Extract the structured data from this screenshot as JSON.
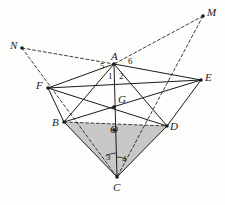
{
  "figure": {
    "background_color": "#fdfdfc",
    "stroke_color": "#1b1b1b",
    "shaded_fill": "#c8c8c8",
    "canvas": {
      "width": 225,
      "height": 205
    }
  },
  "vertices": [
    {
      "id": "N",
      "label": "N",
      "x": 22,
      "y": 48,
      "label_x": 10,
      "label_y": 40,
      "dot": true
    },
    {
      "id": "M",
      "label": "M",
      "x": 203,
      "y": 16,
      "label_x": 207,
      "label_y": 7,
      "dot": true
    },
    {
      "id": "A",
      "label": "A",
      "x": 114,
      "y": 64,
      "label_x": 111,
      "label_y": 51,
      "dot": true
    },
    {
      "id": "F",
      "label": "F",
      "x": 48,
      "y": 88,
      "label_x": 36,
      "label_y": 80,
      "dot": true
    },
    {
      "id": "E",
      "label": "E",
      "x": 201,
      "y": 80,
      "label_x": 205,
      "label_y": 72,
      "dot": true
    },
    {
      "id": "G",
      "label": "G",
      "x": 114,
      "y": 107,
      "label_x": 118,
      "label_y": 94,
      "dot": true
    },
    {
      "id": "B",
      "label": "B",
      "x": 64,
      "y": 122,
      "label_x": 52,
      "label_y": 117,
      "dot": true
    },
    {
      "id": "D",
      "label": "D",
      "x": 167,
      "y": 126,
      "label_x": 170,
      "label_y": 121,
      "dot": true
    },
    {
      "id": "O",
      "label": "O",
      "x": 114,
      "y": 130,
      "label_x": 110,
      "label_y": 124,
      "dot": true
    },
    {
      "id": "C",
      "label": "C",
      "x": 117,
      "y": 177,
      "label_x": 113,
      "label_y": 182,
      "dot": true
    }
  ],
  "angle_labels": [
    {
      "id": "ang1",
      "label": "1",
      "x": 108,
      "y": 72
    },
    {
      "id": "ang2",
      "label": "2",
      "x": 119,
      "y": 72
    },
    {
      "id": "ang3",
      "label": "3",
      "x": 106,
      "y": 153
    },
    {
      "id": "ang4",
      "label": "4",
      "x": 122,
      "y": 155
    },
    {
      "id": "ang5",
      "label": "5",
      "x": 100,
      "y": 62
    },
    {
      "id": "ang6",
      "label": "6",
      "x": 128,
      "y": 57
    }
  ],
  "solid_edges": [
    {
      "id": "A-F",
      "from": "A",
      "to": "F"
    },
    {
      "id": "A-B",
      "from": "A",
      "to": "B"
    },
    {
      "id": "A-D",
      "from": "A",
      "to": "D"
    },
    {
      "id": "A-E",
      "from": "A",
      "to": "E"
    },
    {
      "id": "A-C",
      "from": "A",
      "to": "C"
    },
    {
      "id": "F-B",
      "from": "F",
      "to": "B"
    },
    {
      "id": "F-E",
      "from": "F",
      "to": "E"
    },
    {
      "id": "F-D",
      "from": "F",
      "to": "D"
    },
    {
      "id": "B-E",
      "from": "B",
      "to": "E"
    },
    {
      "id": "B-C",
      "from": "B",
      "to": "C"
    },
    {
      "id": "D-E",
      "from": "D",
      "to": "E"
    },
    {
      "id": "D-C",
      "from": "D",
      "to": "C"
    }
  ],
  "dashed_edges": [
    {
      "id": "B-D",
      "from": "B",
      "to": "D"
    },
    {
      "id": "N-A",
      "from": "N",
      "to": "A"
    },
    {
      "id": "N-C",
      "from": "N",
      "to": "C"
    },
    {
      "id": "M-A",
      "from": "M",
      "to": "A"
    },
    {
      "id": "M-C",
      "from": "M",
      "to": "C"
    }
  ],
  "shaded_region": {
    "id": "triangle-BDC",
    "points": [
      "B",
      "D",
      "C"
    ],
    "fill": "#c8c8c8"
  },
  "angle_arcs": [
    {
      "id": "arc-at-C-left",
      "cx": 117,
      "cy": 177,
      "r": 24,
      "a0": 242,
      "a1": 268
    },
    {
      "id": "arc-at-C-right",
      "cx": 117,
      "cy": 177,
      "r": 20,
      "a0": 270,
      "a1": 296
    }
  ]
}
